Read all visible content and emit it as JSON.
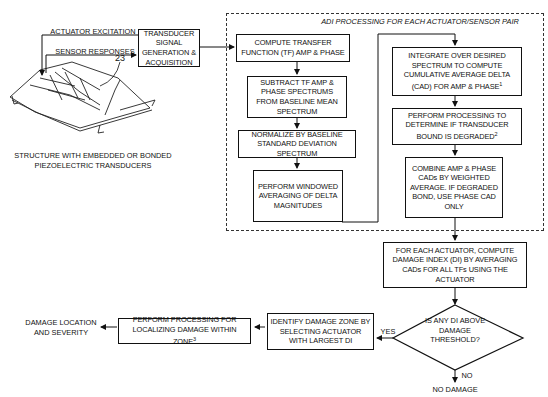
{
  "diagram": {
    "signal_labels": {
      "actuator_excitation": "ACTUATOR EXCITATION",
      "sensor_responses": "SENSOR RESPONSES",
      "reference_numeral": "23"
    },
    "structure_caption": "STRUCTURE WITH EMBEDDED OR BONDED\nPIEZOELECTRIC TRANSDUCERS",
    "transducer_box": "TRANSDUCER SIGNAL GENERATION & ACQUISITION",
    "adi_group_title": "ADI PROCESSING FOR EACH ACTUATOR/SENSOR PAIR",
    "steps": {
      "compute_tf": "COMPUTE TRANSFER FUNCTION (TF) AMP & PHASE",
      "subtract": "SUBTRACT TF AMP & PHASE SPECTRUMS FROM BASELINE MEAN SPECTRUM",
      "normalize": "NORMALIZE BY BASELINE STANDARD DEVIATION SPECTRUM",
      "windowed": "PERFORM WINDOWED AVERAGING OF DELTA MAGNITUDES",
      "integrate": "INTEGRATE OVER DESIRED SPECTRUM TO COMPUTE CUMULATIVE AVERAGE DELTA (CAD) FOR AMP & PHASE",
      "integrate_note": "1",
      "bond_check": "PERFORM PROCESSING TO DETERMINE IF TRANSDUCER BOUND IS DEGRADED",
      "bond_check_note": "2",
      "combine": "COMBINE AMP & PHASE CADs BY WEIGHTED AVERAGE. IF DEGRADED BOND, USE PHASE CAD ONLY",
      "damage_index": "FOR EACH ACTUATOR, COMPUTE DAMAGE INDEX (DI) BY AVERAGING CADs FOR ALL TFs USING THE ACTUATOR",
      "decision": "IS ANY DI ABOVE DAMAGE THRESHOLD?",
      "identify_zone": "IDENTIFY DAMAGE ZONE BY SELECTING ACTUATOR WITH LARGEST DI",
      "localize": "PERFORM PROCESSING FOR LOCALIZING DAMAGE WITHIN ZONE",
      "localize_note": "3",
      "output": "DAMAGE LOCATION AND SEVERITY"
    },
    "branch_labels": {
      "yes": "YES",
      "no": "NO"
    },
    "no_damage": "NO DAMAGE"
  }
}
